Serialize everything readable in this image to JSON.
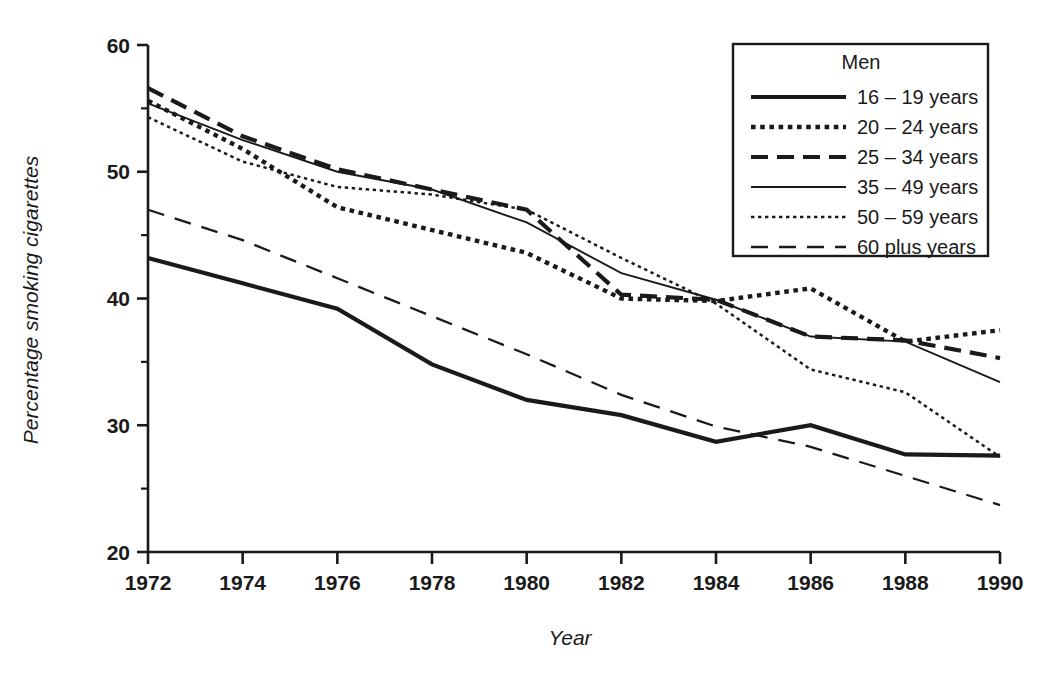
{
  "chart_data": {
    "type": "line",
    "title": "",
    "xlabel": "Year",
    "ylabel": "Percentage smoking cigarettes",
    "x": [
      1972,
      1974,
      1976,
      1978,
      1980,
      1982,
      1984,
      1986,
      1988,
      1990
    ],
    "xtick_labels": [
      "1972",
      "1974",
      "1976",
      "1978",
      "1980",
      "1982",
      "1984",
      "1986",
      "1988",
      "1990"
    ],
    "ytick_labels": [
      "20",
      "30",
      "40",
      "50",
      "60"
    ],
    "yticks": [
      20,
      30,
      40,
      50,
      60
    ],
    "ylim": [
      20,
      60
    ],
    "xlim": [
      1972,
      1990
    ],
    "grid": false,
    "minor_ticks_y": [
      25,
      35,
      45,
      55
    ],
    "minor_ticks_x": [
      1973,
      1975,
      1977,
      1979,
      1981,
      1983,
      1985,
      1987,
      1989
    ],
    "legend_position": "top-right",
    "legend_title": "Men",
    "series": [
      {
        "name": "16 – 19 years",
        "style": "solid-thick",
        "values": [
          43.2,
          41.2,
          39.2,
          34.8,
          32.0,
          30.8,
          28.7,
          30.0,
          27.7,
          27.6
        ]
      },
      {
        "name": "20 – 24 years",
        "style": "dotted-thick",
        "values": [
          55.6,
          51.8,
          47.2,
          45.4,
          43.6,
          40.0,
          39.8,
          40.8,
          36.6,
          37.5
        ]
      },
      {
        "name": "25 – 34 years",
        "style": "dashed-thick",
        "values": [
          56.6,
          52.8,
          50.2,
          48.6,
          47.0,
          40.3,
          39.9,
          37.0,
          36.7,
          35.3
        ]
      },
      {
        "name": "35 – 49 years",
        "style": "solid-thin",
        "values": [
          55.4,
          52.5,
          50.0,
          48.6,
          46.0,
          42.0,
          39.9,
          37.0,
          36.6,
          33.4
        ]
      },
      {
        "name": "50 – 59 years",
        "style": "dotted-thin",
        "values": [
          54.3,
          50.8,
          48.8,
          48.2,
          47.0,
          43.2,
          39.6,
          34.4,
          32.6,
          27.5
        ]
      },
      {
        "name": "60 plus years",
        "style": "dashed-thin",
        "values": [
          47.0,
          44.6,
          41.6,
          38.6,
          35.6,
          32.4,
          29.9,
          28.3,
          26.0,
          23.7
        ]
      }
    ]
  },
  "legend": {
    "title": "Men",
    "items": [
      {
        "label": "16 – 19 years",
        "style": "solid-thick"
      },
      {
        "label": "20 – 24 years",
        "style": "dotted-thick"
      },
      {
        "label": "25 – 34 years",
        "style": "dashed-thick"
      },
      {
        "label": "35 – 49 years",
        "style": "solid-thin"
      },
      {
        "label": "50 – 59 years",
        "style": "dotted-thin"
      },
      {
        "label": "60 plus years",
        "style": "dashed-thin"
      }
    ]
  },
  "axes": {
    "y_title": "Percentage smoking cigarettes",
    "x_title": "Year"
  },
  "colors": {
    "ink": "#1a1a1a",
    "background": "#ffffff"
  }
}
